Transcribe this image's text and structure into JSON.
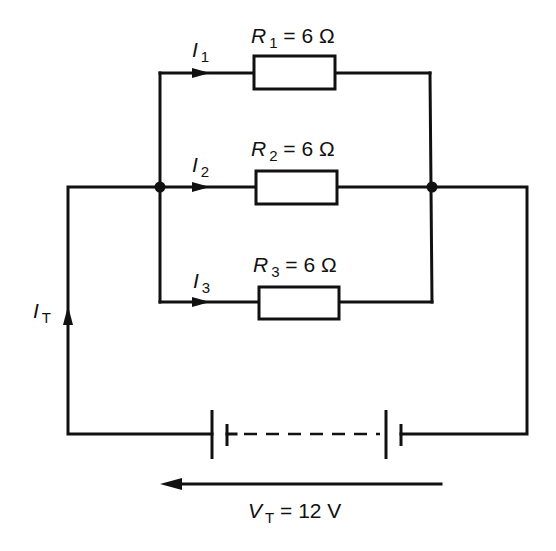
{
  "diagram": {
    "type": "parallel-resistor-circuit",
    "resistors": [
      {
        "id": "R1",
        "symbol": "R",
        "subscript": "1",
        "value": "= 6 Ω",
        "ohms": 6
      },
      {
        "id": "R2",
        "symbol": "R",
        "subscript": "2",
        "value": "= 6 Ω",
        "ohms": 6
      },
      {
        "id": "R3",
        "symbol": "R",
        "subscript": "3",
        "value": "= 6 Ω",
        "ohms": 6
      }
    ],
    "branch_currents": [
      {
        "symbol": "I",
        "subscript": "1"
      },
      {
        "symbol": "I",
        "subscript": "2"
      },
      {
        "symbol": "I",
        "subscript": "3"
      }
    ],
    "total_current": {
      "symbol": "I",
      "subscript": "T"
    },
    "supply": {
      "symbol": "V",
      "subscript": "T",
      "value": "= 12 V",
      "volts": 12,
      "cells": 2
    },
    "colors": {
      "line": "#111111",
      "background": "#ffffff"
    }
  }
}
